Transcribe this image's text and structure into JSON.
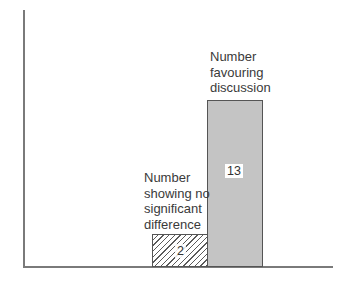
{
  "chart_data": {
    "type": "bar",
    "title": "",
    "xlabel": "",
    "ylabel": "",
    "categories": [
      "Number showing no significant difference",
      "Number favouring discussion"
    ],
    "values": [
      2,
      13
    ],
    "value_labels": [
      "2",
      "13"
    ],
    "bar_styles": [
      "hatched",
      "solid grey"
    ],
    "ylim": [
      0,
      20
    ],
    "grid": false,
    "legend": null,
    "annotations": [
      {
        "target": "Number showing no significant difference",
        "lines": [
          "Number",
          "showing no",
          "significant",
          "difference"
        ]
      },
      {
        "target": "Number favouring discussion",
        "lines": [
          "Number",
          "favouring",
          "discussion"
        ]
      }
    ]
  },
  "colors": {
    "bar_favouring": "#c4c4c4",
    "bar_nodiff_hatch": "#5a5a5a",
    "axis": "#7a7a7a",
    "text": "#3a3a3a"
  }
}
